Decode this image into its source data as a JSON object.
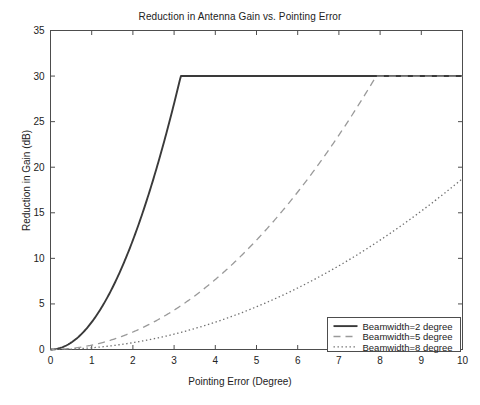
{
  "chart_data": {
    "type": "line",
    "title": "Reduction in Antenna Gain vs. Pointing Error",
    "xlabel": "Pointing Error (Degree)",
    "ylabel": "Reduction in Gain (dB)",
    "xlim": [
      0,
      10
    ],
    "ylim": [
      0,
      35
    ],
    "xticks": [
      "0",
      "1",
      "2",
      "3",
      "4",
      "5",
      "6",
      "7",
      "8",
      "9",
      "10"
    ],
    "yticks": [
      "0",
      "5",
      "10",
      "15",
      "20",
      "25",
      "30",
      "35"
    ],
    "grid": false,
    "legend_position": "lower right",
    "formula_note": "Reduction = min(12*(theta/beamwidth)^2, 30)",
    "saturation_level": 30,
    "series": [
      {
        "name": "Beamwidth=2 degree",
        "beamwidth": 2,
        "style": "solid",
        "color": "#3a3a3a",
        "saturates_at_x": 3.16,
        "x": [
          0,
          0.25,
          0.5,
          0.75,
          1,
          1.25,
          1.5,
          1.75,
          2,
          2.25,
          2.5,
          2.75,
          3,
          3.162,
          3.5,
          4,
          5,
          6,
          7,
          8,
          9,
          10
        ],
        "y": [
          0,
          0.19,
          0.75,
          1.69,
          3,
          4.69,
          6.75,
          9.19,
          12,
          15.19,
          18.75,
          22.69,
          27,
          30,
          30,
          30,
          30,
          30,
          30,
          30,
          30,
          30
        ]
      },
      {
        "name": "Beamwidth=5 degree",
        "beamwidth": 5,
        "style": "dashed",
        "color": "#9a9a9a",
        "saturates_at_x": 7.91,
        "x": [
          0,
          0.5,
          1,
          1.5,
          2,
          2.5,
          3,
          3.5,
          4,
          4.5,
          5,
          5.5,
          6,
          6.5,
          7,
          7.5,
          7.906,
          8.5,
          9,
          9.5,
          10
        ],
        "y": [
          0,
          0.12,
          0.48,
          1.08,
          1.92,
          3,
          4.32,
          5.88,
          7.68,
          9.72,
          12,
          14.52,
          17.28,
          20.28,
          23.52,
          27,
          30,
          30,
          30,
          30,
          30
        ]
      },
      {
        "name": "Beamwidth=8 degree",
        "beamwidth": 8,
        "style": "dotted",
        "color": "#6f6f6f",
        "saturates_at_x": null,
        "x": [
          0,
          0.5,
          1,
          1.5,
          2,
          2.5,
          3,
          3.5,
          4,
          4.5,
          5,
          5.5,
          6,
          6.5,
          7,
          7.5,
          8,
          8.5,
          9,
          9.5,
          10
        ],
        "y": [
          0,
          0.05,
          0.19,
          0.42,
          0.75,
          1.17,
          1.69,
          2.3,
          3,
          3.8,
          4.69,
          5.67,
          6.75,
          7.92,
          9.19,
          10.55,
          12,
          13.55,
          15.19,
          16.92,
          18.75
        ]
      }
    ]
  },
  "legend": {
    "items": [
      {
        "label": "Beamwidth=2 degree"
      },
      {
        "label": "Beamwidth=5 degree"
      },
      {
        "label": "Beamwidth=8 degree"
      }
    ]
  }
}
